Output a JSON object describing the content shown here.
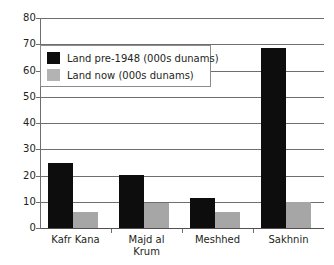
{
  "chart_data": {
    "type": "bar",
    "title": "",
    "subtitle": "",
    "xlabel": "",
    "ylabel": "",
    "categories": [
      "Kafr Kana",
      "Majd al\nKrum",
      "Meshhed",
      "Sakhnin"
    ],
    "series": [
      {
        "name": "Land pre-1948 (000s dunams)",
        "color": "#0d0d0d",
        "values": [
          24.8,
          20.2,
          11.4,
          68.6
        ]
      },
      {
        "name": "Land now (000s dunams)",
        "color": "#a6a6a6",
        "values": [
          6.1,
          9.5,
          6.0,
          10.0
        ]
      }
    ],
    "ylim": [
      0,
      80
    ],
    "yticks": [
      0,
      10,
      20,
      30,
      40,
      50,
      60,
      70,
      80
    ],
    "ytick_labels": [
      "0",
      "10",
      "20",
      "30",
      "40",
      "50",
      "60",
      "70",
      "80"
    ],
    "grid": true,
    "legend_position": "upper-left"
  },
  "legend": {
    "items": [
      {
        "label": "Land pre-1948 (000s dunams)",
        "color": "#0d0d0d"
      },
      {
        "label": "Land now (000s dunams)",
        "color": "#b3b3b3"
      }
    ]
  },
  "colors": {
    "series_dark": "#0d0d0d",
    "series_light": "#a6a6a6",
    "gridline": "#6e6e6e",
    "axis": "#555152",
    "text": "#231f20",
    "background": "#ffffff"
  }
}
